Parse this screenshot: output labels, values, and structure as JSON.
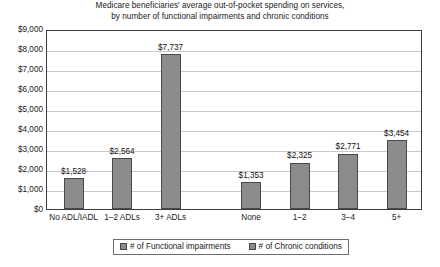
{
  "chart_data": {
    "type": "bar",
    "title": "Medicare beneficiaries' average out-of-pocket spending on services, by number of functional impairments and chronic conditions",
    "title_lines": [
      "Medicare beneficiaries' average out-of-pocket spending on services,",
      "by number of functional impairments and chronic conditions"
    ],
    "xlabel": "",
    "ylabel": "",
    "ylim": [
      0,
      9000
    ],
    "ytick_step": 1000,
    "grid": true,
    "legend_position": "bottom",
    "categories": [
      "No ADL/IADL",
      "1–2 ADLs",
      "3+ ADLs",
      "None",
      "1–2",
      "3–4",
      "5+"
    ],
    "values": [
      1528,
      2564,
      7737,
      1353,
      2325,
      2771,
      3454
    ],
    "value_labels": [
      "$1,528",
      "$2,564",
      "$7,737",
      "$1,353",
      "$2,325",
      "$2,771",
      "$3,454"
    ],
    "groups": [
      {
        "name": "# of Functional impairments",
        "categories": [
          "No ADL/IADL",
          "1–2 ADLs",
          "3+ ADLs"
        ],
        "values": [
          1528,
          2564,
          7737
        ]
      },
      {
        "name": "# of Chronic conditions",
        "categories": [
          "None",
          "1–2",
          "3–4",
          "5+"
        ],
        "values": [
          1353,
          2325,
          2771,
          3454
        ]
      }
    ],
    "ytick_labels": [
      "$9,000",
      "$8,000",
      "$7,000",
      "$6,000",
      "$5,000",
      "$4,000",
      "$3,000",
      "$2,000",
      "$1,000",
      "$0"
    ],
    "ytick_values": [
      9000,
      8000,
      7000,
      6000,
      5000,
      4000,
      3000,
      2000,
      1000,
      0
    ],
    "legend": [
      {
        "label": "# of Functional impairments",
        "color": "#8c8c8c"
      },
      {
        "label": "# of Chronic conditions",
        "color": "#8c8c8c"
      }
    ],
    "colors": {
      "bar_fill": "#8c8c8c",
      "bar_border": "#4a4a4a",
      "gridline": "#c9c9c9",
      "frame": "#3c3c3c",
      "background": "#ffffff",
      "text": "#1a1a1a"
    }
  }
}
